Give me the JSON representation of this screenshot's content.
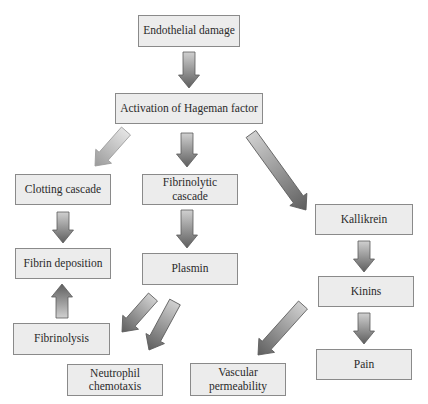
{
  "diagram": {
    "type": "flowchart",
    "nodes": [
      {
        "id": "endothelial",
        "label": "Endothelial damage",
        "x": 138,
        "y": 15,
        "w": 102,
        "h": 32
      },
      {
        "id": "hageman",
        "label": "Activation of Hageman factor",
        "x": 115,
        "y": 93,
        "w": 148,
        "h": 31
      },
      {
        "id": "clotting",
        "label": "Clotting cascade",
        "x": 15,
        "y": 174,
        "w": 96,
        "h": 31
      },
      {
        "id": "fibrinolytic",
        "label": "Fibrinolytic cascade",
        "x": 142,
        "y": 174,
        "w": 96,
        "h": 31
      },
      {
        "id": "kallikrein",
        "label": "Kallikrein",
        "x": 315,
        "y": 204,
        "w": 98,
        "h": 31
      },
      {
        "id": "fibrin",
        "label": "Fibrin deposition",
        "x": 15,
        "y": 248,
        "w": 96,
        "h": 31
      },
      {
        "id": "plasmin",
        "label": "Plasmin",
        "x": 142,
        "y": 253,
        "w": 96,
        "h": 32
      },
      {
        "id": "kinins",
        "label": "Kinins",
        "x": 318,
        "y": 276,
        "w": 96,
        "h": 31
      },
      {
        "id": "fibrinolysis",
        "label": "Fibrinolysis",
        "x": 13,
        "y": 323,
        "w": 97,
        "h": 32
      },
      {
        "id": "pain",
        "label": "Pain",
        "x": 316,
        "y": 349,
        "w": 96,
        "h": 31
      },
      {
        "id": "neutrophil",
        "label": "Neutrophil chemotaxis",
        "x": 67,
        "y": 364,
        "w": 96,
        "h": 32
      },
      {
        "id": "vascular",
        "label": "Vascular permeability",
        "x": 190,
        "y": 363,
        "w": 96,
        "h": 33
      }
    ],
    "edges": [
      {
        "from": "endothelial",
        "to": "hageman",
        "x1": 189,
        "y1": 52,
        "x2": 189,
        "y2": 88
      },
      {
        "from": "hageman",
        "to": "clotting",
        "x1": 126,
        "y1": 131,
        "x2": 95,
        "y2": 166,
        "light": true
      },
      {
        "from": "hageman",
        "to": "fibrinolytic",
        "x1": 187,
        "y1": 133,
        "x2": 187,
        "y2": 167
      },
      {
        "from": "hageman",
        "to": "kallikrein",
        "x1": 251,
        "y1": 134,
        "x2": 306,
        "y2": 210
      },
      {
        "from": "clotting",
        "to": "fibrin",
        "x1": 63,
        "y1": 212,
        "x2": 63,
        "y2": 243
      },
      {
        "from": "fibrinolytic",
        "to": "plasmin",
        "x1": 187,
        "y1": 210,
        "x2": 187,
        "y2": 248
      },
      {
        "from": "fibrinolysis",
        "to": "fibrin",
        "x1": 62,
        "y1": 318,
        "x2": 62,
        "y2": 284
      },
      {
        "from": "plasmin",
        "to": "fibrinolysis",
        "x1": 153,
        "y1": 297,
        "x2": 122,
        "y2": 332
      },
      {
        "from": "plasmin",
        "to": "neutrophil",
        "x1": 175,
        "y1": 302,
        "x2": 149,
        "y2": 350
      },
      {
        "from": "kallikrein",
        "to": "kinins",
        "x1": 364,
        "y1": 241,
        "x2": 364,
        "y2": 272
      },
      {
        "from": "kinins",
        "to": "pain",
        "x1": 364,
        "y1": 313,
        "x2": 364,
        "y2": 344
      },
      {
        "from": "kinins",
        "to": "vascular",
        "x1": 303,
        "y1": 305,
        "x2": 258,
        "y2": 355
      }
    ],
    "colors": {
      "box_fill": "#ececec",
      "box_border": "#8a8a8a",
      "arrow_light": "#c8c8c8",
      "arrow_dark": "#6a6a6a"
    }
  }
}
